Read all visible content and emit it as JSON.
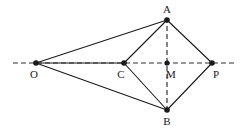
{
  "figure": {
    "kind": "geometry-diagram",
    "width": 247,
    "height": 130,
    "background_color": "#ffffff",
    "stroke_color": "#1a1a1a",
    "dash_color": "#333333",
    "label_color": "#1a1a1a",
    "points": [
      {
        "id": "O",
        "label": "O",
        "x": 36,
        "y": 63,
        "label_x": 34,
        "label_y": 74,
        "dot_r": 2.8
      },
      {
        "id": "C",
        "label": "C",
        "x": 124,
        "y": 63,
        "label_x": 121,
        "label_y": 74,
        "dot_r": 2.8
      },
      {
        "id": "M",
        "label": "M",
        "x": 167,
        "y": 63,
        "label_x": 171,
        "label_y": 74,
        "dot_r": 2.6
      },
      {
        "id": "P",
        "label": "P",
        "x": 212,
        "y": 63,
        "label_x": 216,
        "label_y": 74,
        "dot_r": 2.8
      },
      {
        "id": "A",
        "label": "A",
        "x": 167,
        "y": 20,
        "label_x": 167,
        "label_y": 9,
        "dot_r": 2.8
      },
      {
        "id": "B",
        "label": "B",
        "x": 167,
        "y": 110,
        "label_x": 167,
        "label_y": 121,
        "dot_r": 2.8
      }
    ],
    "solid_segments": [
      {
        "name": "O-A",
        "from": "O",
        "to": "A"
      },
      {
        "name": "O-B",
        "from": "O",
        "to": "B"
      },
      {
        "name": "C-A",
        "from": "C",
        "to": "A"
      },
      {
        "name": "C-B",
        "from": "C",
        "to": "B"
      },
      {
        "name": "A-P",
        "from": "A",
        "to": "P"
      },
      {
        "name": "B-P",
        "from": "B",
        "to": "P"
      },
      {
        "name": "O-C",
        "from": "O",
        "to": "C"
      }
    ],
    "dashed_segments": [
      {
        "name": "horizontal-axis",
        "x1": 13,
        "y1": 63,
        "x2": 237,
        "y2": 63
      },
      {
        "name": "vertical-axis-AB",
        "x1": 167,
        "y1": 18,
        "x2": 167,
        "y2": 112
      }
    ],
    "dash_pattern": "5,3",
    "stroke_width": 1.1,
    "dash_width": 1.2
  }
}
